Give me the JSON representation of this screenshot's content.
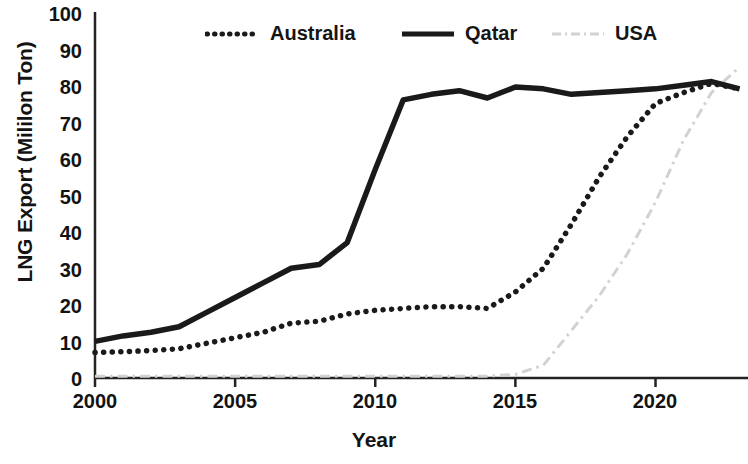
{
  "axes": {
    "ylabel": "LNG Export (Mililon Ton)",
    "xlabel": "Year",
    "yticks": [
      "0",
      "10",
      "20",
      "30",
      "40",
      "50",
      "60",
      "70",
      "80",
      "90",
      "100"
    ],
    "xticks": [
      "2000",
      "2005",
      "2010",
      "2015",
      "2020"
    ]
  },
  "legend": {
    "items": [
      {
        "label": "Australia",
        "style": "dotted",
        "color": "#1a1a1a"
      },
      {
        "label": "Qatar",
        "style": "solid",
        "color": "#1a1a1a"
      },
      {
        "label": "USA",
        "style": "dashdot",
        "color": "#d2d2d2"
      }
    ]
  },
  "chart_data": {
    "type": "line",
    "title": "",
    "xlabel": "Year",
    "ylabel": "LNG Export (Mililon Ton)",
    "xlim": [
      2000,
      2023.3
    ],
    "ylim": [
      0,
      100
    ],
    "grid": false,
    "legend_position": "top",
    "x": [
      2000,
      2001,
      2002,
      2003,
      2004,
      2005,
      2006,
      2007,
      2008,
      2009,
      2010,
      2011,
      2012,
      2013,
      2014,
      2015,
      2016,
      2017,
      2018,
      2019,
      2020,
      2021,
      2022,
      2023
    ],
    "series": [
      {
        "name": "Australia",
        "color": "#1a1a1a",
        "style": "dotted",
        "values": [
          7,
          7.2,
          7.5,
          8,
          9.5,
          11,
          12.5,
          15,
          15.5,
          17.5,
          18.5,
          19,
          19.5,
          19.5,
          19,
          23.5,
          30,
          42,
          55,
          66,
          75,
          78,
          80.5,
          79
        ]
      },
      {
        "name": "Qatar",
        "color": "#1a1a1a",
        "style": "solid",
        "values": [
          10,
          11.5,
          12.5,
          14,
          18,
          22,
          26,
          30,
          31,
          37,
          57,
          76,
          77.5,
          78.5,
          76.5,
          79.5,
          79,
          77.5,
          78,
          78.5,
          79,
          80,
          81,
          79
        ]
      },
      {
        "name": "USA",
        "color": "#d2d2d2",
        "style": "dashdot",
        "values": [
          0.5,
          0.5,
          0.5,
          0.5,
          0.5,
          0.5,
          0.5,
          0.5,
          0.5,
          0.5,
          0.5,
          0.5,
          0.5,
          0.5,
          0.5,
          1,
          3.5,
          13,
          22.5,
          34,
          48,
          65,
          78,
          85
        ]
      }
    ]
  }
}
